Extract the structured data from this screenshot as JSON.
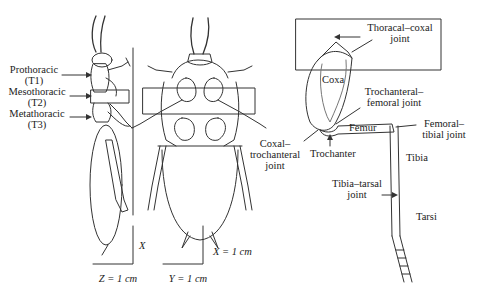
{
  "side_view": {
    "labels": [
      {
        "name": "Prothoracic",
        "code": "(T1)"
      },
      {
        "name": "Mesothoracic",
        "code": "(T2)"
      },
      {
        "name": "Metathoracic",
        "code": "(T3)"
      }
    ],
    "axis_vertical": "X",
    "axis_horizontal": "Z = 1 cm"
  },
  "ventral_view": {
    "axis_vertical": "X = 1 cm",
    "axis_horizontal": "Y = 1 cm"
  },
  "leg_detail": {
    "segments": [
      "Coxa",
      "Femur",
      "Tibia",
      "Tarsi",
      "Trochanter"
    ],
    "joints": {
      "thoracal_coxal": [
        "Thoracal–coxal",
        "joint"
      ],
      "trochanteral_femoral": [
        "Trochanteral–",
        "femoral joint"
      ],
      "coxal_trochanteral": [
        "Coxal–",
        "trochanteral",
        "joint"
      ],
      "femoral_tibial": [
        "Femoral–",
        "tibial joint"
      ],
      "tibia_tarsal": [
        "Tibia–tarsal",
        "joint"
      ]
    }
  },
  "colors": {
    "line": "#333333",
    "background": "#ffffff"
  }
}
